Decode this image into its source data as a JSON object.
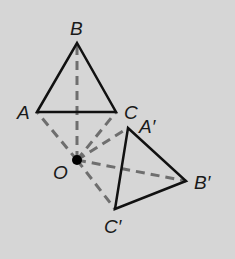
{
  "diagram": {
    "background": "#d6d6d6",
    "colors": {
      "solid": "#111111",
      "dashed": "#6e6e6e",
      "label": "#1a1a1a"
    },
    "center": {
      "name": "O",
      "label": "O",
      "x": 77,
      "y": 160
    },
    "original": {
      "A": {
        "label": "A",
        "x": 37,
        "y": 112
      },
      "B": {
        "label": "B",
        "x": 77,
        "y": 43
      },
      "C": {
        "label": "C",
        "x": 116,
        "y": 112
      }
    },
    "image": {
      "A": {
        "label": "A′",
        "x": 128,
        "y": 128
      },
      "B": {
        "label": "B′",
        "x": 186,
        "y": 181
      },
      "C": {
        "label": "C′",
        "x": 115,
        "y": 209
      }
    }
  }
}
